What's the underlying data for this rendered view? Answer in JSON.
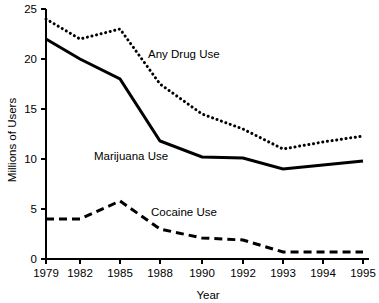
{
  "chart_data": {
    "type": "line",
    "title": "",
    "xlabel": "Year",
    "ylabel": "Millions of Users",
    "categories": [
      "1979",
      "1982",
      "1985",
      "1988",
      "1990",
      "1992",
      "1993",
      "1994",
      "1995"
    ],
    "x_tick_labels": [
      "1979",
      "1982",
      "1985",
      "1988",
      "1990",
      "1992",
      "1993",
      "1994",
      "1995"
    ],
    "y_tick_labels": [
      "0",
      "5",
      "10",
      "15",
      "20",
      "25"
    ],
    "y_ticks": [
      0,
      5,
      10,
      15,
      20,
      25
    ],
    "ylim": [
      0,
      25
    ],
    "grid": false,
    "legend_position": "inline-annotations",
    "series": [
      {
        "name": "Any Drug Use",
        "style": "dotted",
        "label": "Any Drug Use",
        "values": [
          24.0,
          22.0,
          23.0,
          17.5,
          14.5,
          13.0,
          11.0,
          11.7,
          12.3
        ]
      },
      {
        "name": "Marijuana Use",
        "style": "solid",
        "label": "Marijuana Use",
        "values": [
          22.0,
          20.0,
          18.0,
          11.8,
          10.2,
          10.1,
          9.0,
          9.4,
          9.8
        ]
      },
      {
        "name": "Cocaine Use",
        "style": "dashed",
        "label": "Cocaine Use",
        "values": [
          4.0,
          4.0,
          5.8,
          3.0,
          2.1,
          1.9,
          0.7,
          0.7,
          0.7
        ]
      }
    ],
    "annotations": [
      {
        "text": "Any Drug Use",
        "x": 148,
        "y": 58
      },
      {
        "text": "Marijuana Use",
        "x": 94,
        "y": 160
      },
      {
        "text": "Cocaine Use",
        "x": 151,
        "y": 216
      }
    ],
    "colors": {
      "line": "#000000",
      "axis": "#000000",
      "background": "#ffffff"
    }
  }
}
